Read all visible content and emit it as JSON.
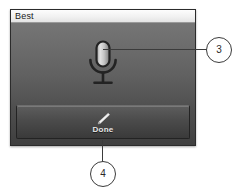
{
  "panel": {
    "title_bar": {
      "title": "Best"
    },
    "mic": {
      "icon": "microphone-icon"
    },
    "done_button": {
      "label": "Done",
      "icon": "pencil-icon"
    }
  },
  "annotations": {
    "callouts": [
      {
        "number": "3",
        "points_to": "microphone-icon"
      },
      {
        "number": "4",
        "points_to": "done-button"
      }
    ]
  },
  "colors": {
    "panel_top": "#7a7a7a",
    "panel_bottom": "#3f3f3f",
    "title_bar": "#f0f0f0",
    "title_text": "#1a1a1a",
    "button_top": "#5d5d5d",
    "button_bottom": "#3a3a3a",
    "button_label": "#e8e8e8",
    "callout_outline": "#3b3b3b",
    "callout_fill": "#ffffff"
  }
}
